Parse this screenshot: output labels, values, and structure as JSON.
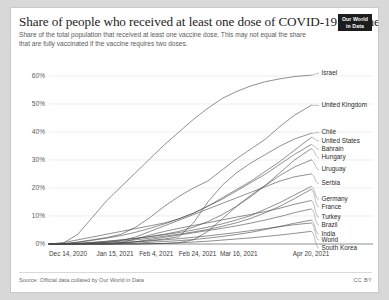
{
  "header": {
    "title": "Share of people who received at least one dose of COVID-19 vaccine",
    "subtitle": "Share of the total population that received at least one vaccine dose. This may not equal the share that are fully vaccinated if the vaccine requires two doses.",
    "logo_line1": "Our World",
    "logo_line2": "in Data"
  },
  "footer": {
    "source": "Source: Official data collated by Our World in Data",
    "license": "CC BY"
  },
  "colors": {
    "line": "#4a4a4a",
    "grid": "#e7e7e7",
    "axis": "#5b5b5b",
    "text": "#2b2b2b",
    "muted": "#5b5b5b",
    "logo_bg": "#1d1d1d",
    "card_bg": "#ffffff",
    "page_bg": "#d8d8d8"
  },
  "chart_data": {
    "type": "line",
    "title": "Share of people who received at least one dose of COVID-19 vaccine",
    "subtitle": "Share of the total population that received at least one vaccine dose. This may not equal the share that are fully vaccinated if the vaccine requires two doses.",
    "xlabel": "",
    "ylabel": "",
    "grid": true,
    "legend_position": "right-inline-labels",
    "ylim": [
      0,
      65
    ],
    "yticks": [
      0,
      10,
      20,
      30,
      40,
      50,
      60
    ],
    "ytick_labels": [
      "0%",
      "10%",
      "20%",
      "30%",
      "40%",
      "50%",
      "60%"
    ],
    "xlim": [
      0,
      127
    ],
    "xticks": [
      0,
      32,
      52,
      72,
      92,
      127
    ],
    "xtick_labels": [
      "Dec 14, 2020",
      "Jan 15, 2021",
      "Feb 4, 2021",
      "Feb 24, 2021",
      "Mar 16, 2021",
      "Apr 20, 2021"
    ],
    "x_unit": "days since Dec 14, 2020",
    "x": [
      0,
      7,
      14,
      21,
      28,
      35,
      42,
      49,
      56,
      63,
      70,
      77,
      84,
      91,
      98,
      105,
      112,
      119,
      127
    ],
    "series": [
      {
        "name": "Israel",
        "label": "Israel",
        "values": [
          0.0,
          0.3,
          3.5,
          9.5,
          15.5,
          20.5,
          25.5,
          30.5,
          35.5,
          40.0,
          44.5,
          48.5,
          52.0,
          54.5,
          56.5,
          58.0,
          59.0,
          59.8,
          60.3
        ],
        "final_value": 60.3
      },
      {
        "name": "United Kingdom",
        "label": "United Kingdom",
        "values": [
          0.0,
          0.1,
          0.7,
          1.5,
          2.3,
          3.5,
          6.0,
          9.5,
          13.5,
          17.0,
          20.0,
          22.5,
          26.5,
          30.5,
          34.0,
          37.5,
          42.0,
          46.0,
          49.5
        ],
        "final_value": 49.5
      },
      {
        "name": "Chile",
        "label": "Chile",
        "values": [
          0.0,
          0.0,
          0.1,
          0.2,
          0.3,
          0.5,
          0.8,
          1.2,
          1.8,
          2.6,
          7.5,
          15.0,
          21.0,
          25.5,
          29.0,
          32.0,
          35.0,
          37.5,
          39.5
        ],
        "final_value": 39.5
      },
      {
        "name": "United States",
        "label": "United States",
        "values": [
          0.0,
          0.1,
          0.6,
          1.3,
          2.1,
          3.0,
          4.2,
          5.6,
          7.2,
          9.0,
          11.0,
          13.5,
          16.5,
          19.5,
          22.5,
          26.0,
          29.5,
          33.5,
          38.0
        ],
        "final_value": 38.0
      },
      {
        "name": "Bahrain",
        "label": "Bahrain",
        "values": [
          0.0,
          0.5,
          1.5,
          2.5,
          3.5,
          4.5,
          5.5,
          6.5,
          7.5,
          9.0,
          11.0,
          13.5,
          16.0,
          19.0,
          22.0,
          25.0,
          28.5,
          32.0,
          35.5
        ],
        "final_value": 35.5
      },
      {
        "name": "Hungary",
        "label": "Hungary",
        "values": [
          0.0,
          0.0,
          0.2,
          0.5,
          0.9,
          1.4,
          2.0,
          2.7,
          3.5,
          4.5,
          6.0,
          8.0,
          10.5,
          13.5,
          17.0,
          21.0,
          25.5,
          30.0,
          34.0
        ],
        "final_value": 34.0
      },
      {
        "name": "Uruguay",
        "label": "Uruguay",
        "values": [
          0.0,
          0.0,
          0.0,
          0.0,
          0.0,
          0.0,
          0.0,
          0.1,
          0.2,
          0.5,
          1.5,
          4.5,
          9.0,
          13.5,
          17.5,
          21.0,
          24.5,
          27.5,
          30.0
        ],
        "final_value": 30.0
      },
      {
        "name": "Serbia",
        "label": "Serbia",
        "values": [
          0.0,
          0.0,
          0.1,
          0.3,
          0.6,
          1.2,
          2.5,
          4.5,
          6.5,
          8.5,
          10.5,
          12.5,
          14.5,
          16.5,
          18.5,
          20.5,
          22.5,
          24.0,
          25.0
        ],
        "final_value": 25.0
      },
      {
        "name": "Germany",
        "label": "Germany",
        "values": [
          0.0,
          0.1,
          0.3,
          0.6,
          1.0,
          1.5,
          2.0,
          2.6,
          3.3,
          4.1,
          5.0,
          6.0,
          7.2,
          8.6,
          10.2,
          12.5,
          14.8,
          17.5,
          20.5
        ],
        "final_value": 20.5
      },
      {
        "name": "France",
        "label": "France",
        "values": [
          0.0,
          0.0,
          0.1,
          0.3,
          0.6,
          1.0,
          1.5,
          2.1,
          2.8,
          3.5,
          4.3,
          5.2,
          6.3,
          7.6,
          9.2,
          11.2,
          13.5,
          16.2,
          19.5
        ],
        "final_value": 19.5
      },
      {
        "name": "Turkey",
        "label": "Turkey",
        "values": [
          0.0,
          0.0,
          0.0,
          0.0,
          0.0,
          0.5,
          1.8,
          3.2,
          4.5,
          5.6,
          6.6,
          7.6,
          8.6,
          9.6,
          10.6,
          11.6,
          12.8,
          14.2,
          15.5
        ],
        "final_value": 15.5
      },
      {
        "name": "Brazil",
        "label": "Brazil",
        "values": [
          0.0,
          0.0,
          0.0,
          0.0,
          0.0,
          0.2,
          0.8,
          1.6,
          2.4,
          3.2,
          4.0,
          4.8,
          5.6,
          6.5,
          7.5,
          8.6,
          9.8,
          11.2,
          12.5
        ],
        "final_value": 12.5
      },
      {
        "name": "India",
        "label": "India",
        "values": [
          0.0,
          0.0,
          0.0,
          0.0,
          0.0,
          0.1,
          0.3,
          0.6,
          0.9,
          1.2,
          1.6,
          2.1,
          2.7,
          3.4,
          4.2,
          5.2,
          6.3,
          7.4,
          8.5
        ],
        "final_value": 8.5
      },
      {
        "name": "World",
        "label": "World",
        "values": [
          0.0,
          0.0,
          0.1,
          0.2,
          0.3,
          0.5,
          0.8,
          1.1,
          1.5,
          1.9,
          2.4,
          2.9,
          3.5,
          4.1,
          4.8,
          5.5,
          6.2,
          6.9,
          7.5
        ],
        "final_value": 7.5
      },
      {
        "name": "South Korea",
        "label": "South Korea",
        "values": [
          0.0,
          0.0,
          0.0,
          0.0,
          0.0,
          0.0,
          0.0,
          0.1,
          0.2,
          0.4,
          0.7,
          1.0,
          1.4,
          1.8,
          2.2,
          2.7,
          3.2,
          3.8,
          4.5
        ],
        "final_value": 4.5
      }
    ],
    "label_y_positions": [
      {
        "name": "Israel",
        "y": 61.0
      },
      {
        "name": "United Kingdom",
        "y": 49.5
      },
      {
        "name": "Chile",
        "y": 39.8
      },
      {
        "name": "United States",
        "y": 36.8
      },
      {
        "name": "Bahrain",
        "y": 33.8
      },
      {
        "name": "Hungary",
        "y": 30.8
      },
      {
        "name": "Uruguay",
        "y": 26.5
      },
      {
        "name": "Serbia",
        "y": 21.5
      },
      {
        "name": "Germany",
        "y": 16.0
      },
      {
        "name": "France",
        "y": 13.2
      },
      {
        "name": "Turkey",
        "y": 9.5
      },
      {
        "name": "Brazil",
        "y": 6.7
      },
      {
        "name": "India",
        "y": 3.5
      },
      {
        "name": "World",
        "y": 1.4
      },
      {
        "name": "South Korea",
        "y": -1.5
      }
    ]
  }
}
